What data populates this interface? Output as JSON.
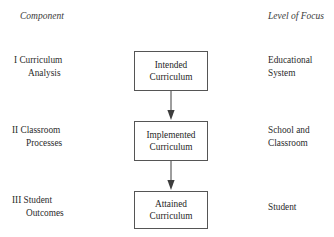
{
  "headers": {
    "component": "Component",
    "level_of_focus": "Level of Focus"
  },
  "rows": [
    {
      "component": {
        "line_1": "I Curriculum",
        "line_2": "Analysis"
      },
      "box": {
        "line_1": "Intended",
        "line_2": "Curriculum"
      },
      "focus": {
        "line_1": "Educational",
        "line_2": "System"
      }
    },
    {
      "component": {
        "line_1": "II Classroom",
        "line_2": "Processes"
      },
      "box": {
        "line_1": "Implemented",
        "line_2": "Curriculum"
      },
      "focus": {
        "line_1": "School and",
        "line_2": "Classroom"
      }
    },
    {
      "component": {
        "line_1": "III Student",
        "line_2": "Outcomes"
      },
      "box": {
        "line_1": "Attained",
        "line_2": "Curriculum"
      },
      "focus": {
        "line_1": "Student",
        "line_2": ""
      }
    }
  ],
  "connectors": [
    {
      "from": "Intended Curriculum",
      "to": "Implemented Curriculum",
      "direction": "down"
    },
    {
      "from": "Implemented Curriculum",
      "to": "Attained Curriculum",
      "direction": "down"
    }
  ],
  "colors": {
    "background": "#ffffff",
    "text": "#2b2b2b",
    "box_border": "#555555",
    "arrow": "#3d3d3d"
  }
}
